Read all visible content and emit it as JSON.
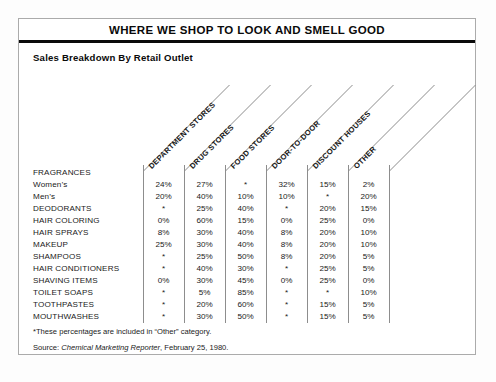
{
  "title": "WHERE WE SHOP TO LOOK AND SMELL GOOD",
  "subtitle": "Sales Breakdown By Retail Outlet",
  "footnote": "*These percentages are included in “Other” category.",
  "source": {
    "prefix": "Source: ",
    "publication": "Chemical Marketing Reporter",
    "suffix": ", February 25, 1980."
  },
  "colors": {
    "ink": "#111111",
    "rule": "#0a0a0a",
    "frame": "#ababab",
    "paper": "#ffffff"
  },
  "chart_data": {
    "type": "table",
    "title": "WHERE WE SHOP TO LOOK AND SMELL GOOD",
    "subtitle": "Sales Breakdown By Retail Outlet",
    "columns": [
      "DEPARTMENT STORES",
      "DRUG STORES",
      "FOOD STORES",
      "DOOR-TO-DOOR",
      "DISCOUNT HOUSES",
      "OTHER"
    ],
    "row_header": "",
    "rows": [
      {
        "label": "FRAGRANCES",
        "group": true,
        "values": [
          "",
          "",
          "",
          "",
          "",
          ""
        ]
      },
      {
        "label": "Women’s",
        "group": false,
        "values": [
          "24%",
          "27%",
          "*",
          "32%",
          "15%",
          "2%"
        ]
      },
      {
        "label": "Men’s",
        "group": false,
        "values": [
          "20%",
          "40%",
          "10%",
          "10%",
          "*",
          "20%"
        ]
      },
      {
        "label": "DEODORANTS",
        "group": false,
        "values": [
          "*",
          "25%",
          "40%",
          "*",
          "20%",
          "15%"
        ]
      },
      {
        "label": "HAIR COLORING",
        "group": false,
        "values": [
          "0%",
          "60%",
          "15%",
          "0%",
          "25%",
          "0%"
        ]
      },
      {
        "label": "HAIR SPRAYS",
        "group": false,
        "values": [
          "8%",
          "30%",
          "40%",
          "8%",
          "20%",
          "10%"
        ]
      },
      {
        "label": "MAKEUP",
        "group": false,
        "values": [
          "25%",
          "30%",
          "40%",
          "8%",
          "20%",
          "10%"
        ]
      },
      {
        "label": "SHAMPOOS",
        "group": false,
        "values": [
          "*",
          "25%",
          "50%",
          "8%",
          "20%",
          "5%"
        ]
      },
      {
        "label": "HAIR CONDITIONERS",
        "group": false,
        "values": [
          "*",
          "40%",
          "30%",
          "*",
          "25%",
          "5%"
        ]
      },
      {
        "label": "SHAVING ITEMS",
        "group": false,
        "values": [
          "0%",
          "30%",
          "45%",
          "0%",
          "25%",
          "0%"
        ]
      },
      {
        "label": "TOILET SOAPS",
        "group": false,
        "values": [
          "*",
          "5%",
          "85%",
          "*",
          "*",
          "10%"
        ]
      },
      {
        "label": "TOOTHPASTES",
        "group": false,
        "values": [
          "*",
          "20%",
          "60%",
          "*",
          "15%",
          "5%"
        ]
      },
      {
        "label": "MOUTHWASHES",
        "group": false,
        "values": [
          "*",
          "30%",
          "50%",
          "*",
          "15%",
          "5%"
        ]
      }
    ],
    "notes": [
      "*These percentages are included in “Other” category."
    ],
    "units": "percent of sales",
    "legend": "none",
    "grid": "column-separators-only"
  }
}
